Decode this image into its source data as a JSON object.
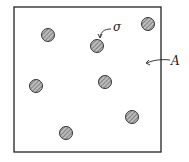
{
  "diagram": {
    "labels": {
      "particle": "σ",
      "area": "A"
    },
    "particle_count": 7,
    "colors": {
      "stroke": "#222222",
      "particle_fill": "#9a9a9a",
      "background": "#ffffff"
    }
  }
}
